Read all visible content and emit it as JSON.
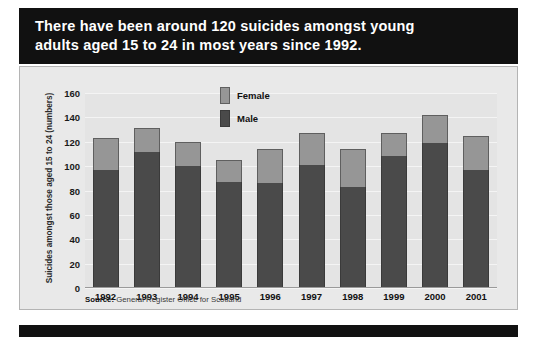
{
  "title": {
    "line1": "There have been around 120 suicides amongst young",
    "line2": "adults aged 15 to 24 in most years since 1992."
  },
  "legend": {
    "female_label": "Female",
    "male_label": "Male",
    "female_color": "#969696",
    "male_color": "#4a4a4a"
  },
  "source": {
    "prefix": "Source:",
    "text": "General Register Office for Scotland"
  },
  "chart_data": {
    "type": "bar",
    "stacked": true,
    "title": "There have been around 120 suicides amongst young adults aged 15 to 24 in most years since 1992.",
    "xlabel": "",
    "ylabel": "Suicides amongst those aged 15 to 24 (numbers)",
    "ylim": [
      0,
      160
    ],
    "yticks": [
      0,
      20,
      40,
      60,
      80,
      100,
      120,
      140,
      160
    ],
    "ytick_labels": [
      "0",
      "20",
      "40",
      "60",
      "80",
      "100",
      "120",
      "140",
      "160"
    ],
    "grid": true,
    "legend_position": "top-center",
    "categories": [
      "1992",
      "1993",
      "1994",
      "1995",
      "1996",
      "1997",
      "1998",
      "1999",
      "2000",
      "2001"
    ],
    "series": [
      {
        "name": "Male",
        "color": "#4a4a4a",
        "values": [
          97,
          112,
          100,
          87,
          86,
          101,
          83,
          108,
          119,
          97
        ]
      },
      {
        "name": "Female",
        "color": "#969696",
        "values": [
          26,
          19,
          20,
          18,
          28,
          26,
          31,
          19,
          23,
          28
        ]
      }
    ],
    "totals": [
      123,
      131,
      120,
      105,
      114,
      127,
      114,
      127,
      142,
      125
    ]
  }
}
